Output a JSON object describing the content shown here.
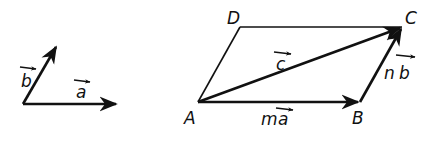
{
  "diagram": {
    "colors": {
      "stroke": "#111111",
      "background": "#ffffff"
    },
    "basis_vectors": {
      "a": {
        "label": "a",
        "arrow_over": true
      },
      "b": {
        "label": "b",
        "arrow_over": true
      }
    },
    "parallelogram": {
      "vertices": {
        "A": "A",
        "B": "B",
        "C": "C",
        "D": "D"
      },
      "edges": {
        "AB": {
          "label_coef": "m",
          "label_vec": "a"
        },
        "BC": {
          "label_coef": "n",
          "label_vec": "b"
        },
        "AC": {
          "label_vec": "c"
        }
      }
    }
  }
}
